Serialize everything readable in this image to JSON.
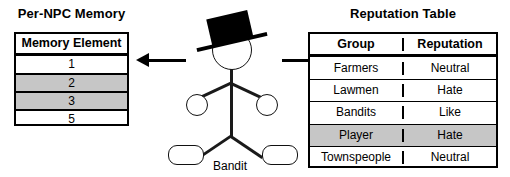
{
  "panels": {
    "memory": {
      "title": "Per-NPC Memory",
      "header": "Memory Element",
      "rows": [
        {
          "value": "1",
          "shaded": false
        },
        {
          "value": "2",
          "shaded": true
        },
        {
          "value": "3",
          "shaded": true
        },
        {
          "value": "5",
          "shaded": false
        }
      ]
    },
    "reputation": {
      "title": "Reputation Table",
      "headers": {
        "group": "Group",
        "reputation": "Reputation"
      },
      "rows": [
        {
          "group": "Farmers",
          "reputation": "Neutral",
          "shaded": false
        },
        {
          "group": "Lawmen",
          "reputation": "Hate",
          "shaded": false
        },
        {
          "group": "Bandits",
          "reputation": "Like",
          "shaded": false
        },
        {
          "group": "Player",
          "reputation": "Hate",
          "shaded": true
        },
        {
          "group": "Townspeople",
          "reputation": "Neutral",
          "shaded": false
        }
      ]
    }
  },
  "figure": {
    "label": "Bandit",
    "hat": "top-hat",
    "parts": [
      "head",
      "torso",
      "arms",
      "hands",
      "legs",
      "feet"
    ]
  },
  "arrows": {
    "left": "arrow-pointing-left",
    "right": "arrow-pointing-right"
  },
  "colors": {
    "shaded_row": "#c6c6c6",
    "stroke": "#000000",
    "background": "#ffffff"
  }
}
